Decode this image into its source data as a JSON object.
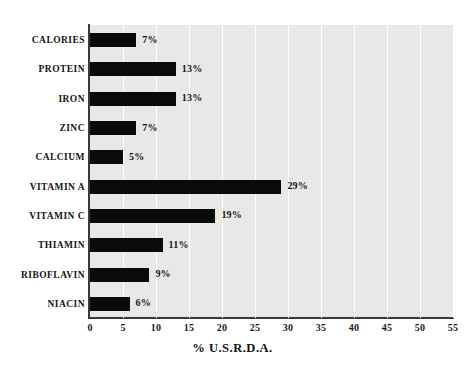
{
  "chart_data": {
    "type": "bar",
    "orientation": "horizontal",
    "title": "",
    "xlabel": "% U.S.R.D.A.",
    "ylabel": "",
    "xlim": [
      0,
      55
    ],
    "xticks": [
      "0",
      "5",
      "10",
      "15",
      "20",
      "25",
      "30",
      "35",
      "40",
      "45",
      "50",
      "55"
    ],
    "grid": "vertical-white-gridlines",
    "legend": "none",
    "categories": [
      "CALORIES",
      "PROTEIN",
      "IRON",
      "ZINC",
      "CALCIUM",
      "VITAMIN A",
      "VITAMIN C",
      "THIAMIN",
      "RIBOFLAVIN",
      "NIACIN"
    ],
    "values": [
      7,
      13,
      13,
      7,
      5,
      29,
      19,
      11,
      9,
      6
    ],
    "data_labels": [
      "7%",
      "13%",
      "13%",
      "7%",
      "5%",
      "29%",
      "19%",
      "11%",
      "9%",
      "6%"
    ],
    "bar_color": "#0a0a0a",
    "plot_background": "#e8e8e8",
    "gridline_color": "#ffffff",
    "axis_color": "#3a3a3a",
    "page_background": "#ffffff"
  }
}
